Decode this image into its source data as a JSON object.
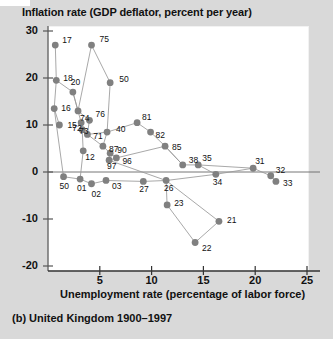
{
  "chart_data": {
    "type": "scatter",
    "title": "Inflation rate (GDP deflator, percent per year)",
    "ylabel": "Inflation rate (GDP deflator, percent per year)",
    "xlabel": "Unemployment rate (percentage of labor force)",
    "caption": "(b) United Kingdom 1900–1997",
    "footnote": "",
    "xlim": [
      0,
      26
    ],
    "ylim": [
      -20,
      30
    ],
    "xticks": [
      5,
      10,
      15,
      20,
      25
    ],
    "yticks": [
      30,
      20,
      10,
      0,
      -10,
      -20
    ],
    "grid": false,
    "legend": "none",
    "connected": true,
    "marker_color": "#808080",
    "line_color": "#999999",
    "points": [
      {
        "label": "17",
        "x": 0.7,
        "y": 27.0
      },
      {
        "label": "18",
        "x": 0.8,
        "y": 19.5
      },
      {
        "label": "16",
        "x": 0.6,
        "y": 13.5
      },
      {
        "label": "15",
        "x": 1.1,
        "y": 10.0
      },
      {
        "label": "20",
        "x": 2.4,
        "y": 17.0
      },
      {
        "label": "75",
        "x": 4.2,
        "y": 27.0
      },
      {
        "label": "50",
        "x": 6.0,
        "y": 19.0
      },
      {
        "label": "74",
        "x": 2.9,
        "y": 13.0
      },
      {
        "label": "73",
        "x": 3.2,
        "y": 10.5
      },
      {
        "label": "76",
        "x": 4.0,
        "y": 11.0
      },
      {
        "label": "72",
        "x": 3.3,
        "y": 9.0
      },
      {
        "label": "71",
        "x": 3.8,
        "y": 8.0
      },
      {
        "label": "40",
        "x": 5.7,
        "y": 8.5
      },
      {
        "label": "87",
        "x": 5.3,
        "y": 5.5
      },
      {
        "label": "90",
        "x": 6.0,
        "y": 4.0
      },
      {
        "label": "96",
        "x": 6.6,
        "y": 3.0
      },
      {
        "label": "97",
        "x": 5.9,
        "y": 2.5
      },
      {
        "label": "12",
        "x": 3.4,
        "y": 4.5
      },
      {
        "label": "81",
        "x": 8.6,
        "y": 10.5
      },
      {
        "label": "82",
        "x": 9.9,
        "y": 8.5
      },
      {
        "label": "85",
        "x": 11.3,
        "y": 5.5
      },
      {
        "label": "38",
        "x": 13.0,
        "y": 1.5
      },
      {
        "label": "35",
        "x": 14.5,
        "y": 1.5
      },
      {
        "label": "31",
        "x": 19.8,
        "y": 0.8
      },
      {
        "label": "32",
        "x": 21.5,
        "y": -0.8
      },
      {
        "label": "33",
        "x": 22.0,
        "y": -2.0
      },
      {
        "label": "34",
        "x": 16.2,
        "y": -0.5
      },
      {
        "label": "26",
        "x": 11.4,
        "y": -1.8
      },
      {
        "label": "27",
        "x": 9.2,
        "y": -2.0
      },
      {
        "label": "50b",
        "x": 1.5,
        "y": -1.0
      },
      {
        "label": "01",
        "x": 3.1,
        "y": -1.5
      },
      {
        "label": "02",
        "x": 4.2,
        "y": -2.5
      },
      {
        "label": "03",
        "x": 5.6,
        "y": -1.8
      },
      {
        "label": "23",
        "x": 11.5,
        "y": -7.0
      },
      {
        "label": "21",
        "x": 16.5,
        "y": -10.5
      },
      {
        "label": "22",
        "x": 14.2,
        "y": -15.0
      }
    ]
  }
}
